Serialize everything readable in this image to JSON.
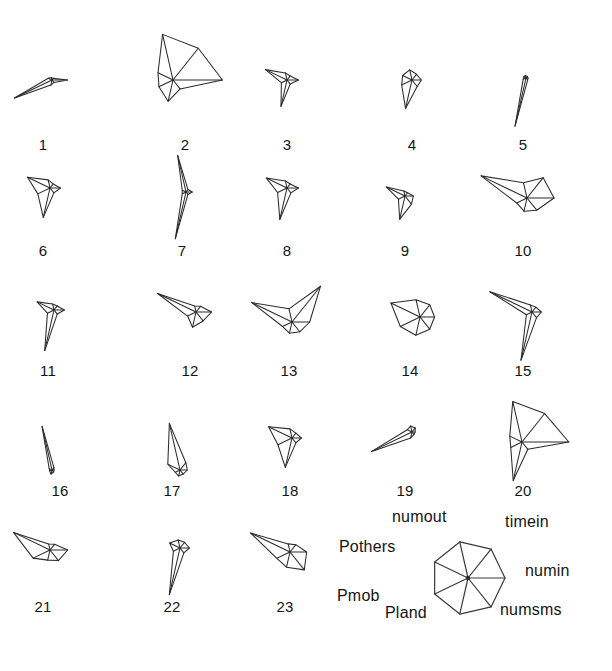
{
  "figure": {
    "type": "star-glyph-plot",
    "background": "#ffffff",
    "stroke_color": "#2b2b2b",
    "width": 612,
    "height": 671
  },
  "chart_data": {
    "type": "radar",
    "title": "",
    "subtitle": "",
    "xlabel": "",
    "ylabel": "",
    "grid": false,
    "legend_position": "bottom-right",
    "variables": [
      "numin",
      "timein",
      "numout",
      "Pothers",
      "Pmob",
      "Pland",
      "numsms"
    ],
    "axis_angles_deg": [
      0,
      51.43,
      102.86,
      154.29,
      205.71,
      257.14,
      308.57
    ],
    "axis_label_order_ccw_from_east": [
      "numin",
      "timein",
      "numout",
      "Pothers",
      "Pmob",
      "Pland",
      "numsms"
    ],
    "value_range": [
      0,
      1
    ],
    "radius_px": 52,
    "legend": {
      "center_x": 468,
      "center_y": 578,
      "radius_px": 37,
      "labels": {
        "numin": "numin",
        "timein": "timein",
        "numout": "numout",
        "Pothers": "Pothers",
        "Pmob": "Pmob",
        "Pland": "Pland",
        "numsms": "numsms"
      }
    },
    "series": [
      {
        "name": "1",
        "label": "1",
        "cx": 52,
        "cy": 80,
        "values": [
          0.3,
          0.04,
          0.05,
          0.08,
          0.8,
          0.1,
          0.06
        ]
      },
      {
        "name": "2",
        "label": "2",
        "cx": 173,
        "cy": 80,
        "values": [
          0.95,
          0.78,
          0.9,
          0.32,
          0.3,
          0.42,
          0.22
        ]
      },
      {
        "name": "3",
        "label": "3",
        "cx": 287,
        "cy": 80,
        "values": [
          0.22,
          0.1,
          0.14,
          0.46,
          0.12,
          0.52,
          0.1
        ]
      },
      {
        "name": "4",
        "label": "4",
        "cx": 412,
        "cy": 80,
        "values": [
          0.18,
          0.14,
          0.2,
          0.2,
          0.22,
          0.56,
          0.16
        ]
      },
      {
        "name": "5",
        "label": "5",
        "cx": 526,
        "cy": 78,
        "values": [
          0.04,
          0.04,
          0.05,
          0.05,
          0.06,
          0.95,
          0.05
        ]
      },
      {
        "name": "6",
        "label": "6",
        "cx": 50,
        "cy": 188,
        "values": [
          0.2,
          0.1,
          0.16,
          0.48,
          0.26,
          0.58,
          0.12
        ]
      },
      {
        "name": "7",
        "label": "7",
        "cx": 186,
        "cy": 192,
        "values": [
          0.12,
          0.06,
          0.72,
          0.08,
          0.08,
          0.92,
          0.06
        ]
      },
      {
        "name": "8",
        "label": "8",
        "cx": 287,
        "cy": 188,
        "values": [
          0.22,
          0.1,
          0.14,
          0.44,
          0.2,
          0.62,
          0.12
        ]
      },
      {
        "name": "9",
        "label": "9",
        "cx": 405,
        "cy": 196,
        "values": [
          0.16,
          0.08,
          0.1,
          0.4,
          0.14,
          0.46,
          0.2
        ]
      },
      {
        "name": "10",
        "label": "10",
        "cx": 527,
        "cy": 198,
        "values": [
          0.52,
          0.5,
          0.3,
          0.98,
          0.22,
          0.26,
          0.3
        ]
      },
      {
        "name": "11",
        "label": "11",
        "cx": 54,
        "cy": 310,
        "values": [
          0.2,
          0.1,
          0.12,
          0.36,
          0.14,
          0.8,
          0.1
        ]
      },
      {
        "name": "12",
        "label": "12",
        "cx": 196,
        "cy": 312,
        "values": [
          0.3,
          0.14,
          0.12,
          0.82,
          0.18,
          0.3,
          0.22
        ]
      },
      {
        "name": "13",
        "label": "13",
        "cx": 292,
        "cy": 322,
        "values": [
          0.34,
          0.88,
          0.26,
          0.86,
          0.2,
          0.22,
          0.24
        ]
      },
      {
        "name": "14",
        "label": "14",
        "cx": 420,
        "cy": 317,
        "values": [
          0.28,
          0.3,
          0.34,
          0.62,
          0.42,
          0.36,
          0.3
        ]
      },
      {
        "name": "15",
        "label": "15",
        "cx": 532,
        "cy": 312,
        "values": [
          0.18,
          0.12,
          0.14,
          0.9,
          0.12,
          0.95,
          0.14
        ]
      },
      {
        "name": "16",
        "label": "16",
        "cx": 52,
        "cy": 470,
        "values": [
          0.04,
          0.06,
          0.86,
          0.06,
          0.05,
          0.08,
          0.05
        ]
      },
      {
        "name": "17",
        "label": "17",
        "cx": 180,
        "cy": 470,
        "values": [
          0.14,
          0.18,
          0.92,
          0.26,
          0.1,
          0.12,
          0.1
        ]
      },
      {
        "name": "18",
        "label": "18",
        "cx": 292,
        "cy": 438,
        "values": [
          0.18,
          0.12,
          0.18,
          0.5,
          0.3,
          0.58,
          0.12
        ]
      },
      {
        "name": "19",
        "label": "19",
        "cx": 412,
        "cy": 432,
        "values": [
          0.06,
          0.1,
          0.12,
          0.1,
          0.86,
          0.12,
          0.06
        ]
      },
      {
        "name": "20",
        "label": "20",
        "cx": 522,
        "cy": 442,
        "values": [
          0.9,
          0.7,
          0.8,
          0.26,
          0.24,
          0.76,
          0.18
        ]
      },
      {
        "name": "21",
        "label": "21",
        "cx": 50,
        "cy": 550,
        "values": [
          0.34,
          0.14,
          0.12,
          0.78,
          0.36,
          0.2,
          0.26
        ]
      },
      {
        "name": "22",
        "label": "22",
        "cx": 180,
        "cy": 548,
        "values": [
          0.18,
          0.14,
          0.16,
          0.22,
          0.14,
          0.92,
          0.12
        ]
      },
      {
        "name": "23",
        "label": "23",
        "cx": 290,
        "cy": 552,
        "values": [
          0.32,
          0.18,
          0.16,
          0.84,
          0.28,
          0.3,
          0.44
        ]
      }
    ],
    "glyph_labels": [
      {
        "text": "1",
        "x": 43,
        "y": 136
      },
      {
        "text": "2",
        "x": 185,
        "y": 136
      },
      {
        "text": "3",
        "x": 287,
        "y": 136
      },
      {
        "text": "4",
        "x": 412,
        "y": 136
      },
      {
        "text": "5",
        "x": 523,
        "y": 136
      },
      {
        "text": "6",
        "x": 43,
        "y": 242
      },
      {
        "text": "7",
        "x": 182,
        "y": 242
      },
      {
        "text": "8",
        "x": 287,
        "y": 242
      },
      {
        "text": "9",
        "x": 405,
        "y": 242
      },
      {
        "text": "10",
        "x": 523,
        "y": 242
      },
      {
        "text": "11",
        "x": 48,
        "y": 362
      },
      {
        "text": "12",
        "x": 190,
        "y": 362
      },
      {
        "text": "13",
        "x": 289,
        "y": 362
      },
      {
        "text": "14",
        "x": 410,
        "y": 362
      },
      {
        "text": "15",
        "x": 523,
        "y": 362
      },
      {
        "text": "16",
        "x": 60,
        "y": 482
      },
      {
        "text": "17",
        "x": 172,
        "y": 482
      },
      {
        "text": "18",
        "x": 290,
        "y": 482
      },
      {
        "text": "19",
        "x": 405,
        "y": 482
      },
      {
        "text": "20",
        "x": 523,
        "y": 482
      },
      {
        "text": "21",
        "x": 43,
        "y": 598
      },
      {
        "text": "22",
        "x": 172,
        "y": 598
      },
      {
        "text": "23",
        "x": 285,
        "y": 598
      }
    ],
    "legend_axis_labels": [
      {
        "key": "numout",
        "text": "numout",
        "x": 392,
        "y": 508,
        "anchor": "start"
      },
      {
        "key": "timein",
        "text": "timein",
        "x": 505,
        "y": 513,
        "anchor": "start"
      },
      {
        "key": "Pothers",
        "text": "Pothers",
        "x": 339,
        "y": 538,
        "anchor": "start"
      },
      {
        "key": "numin",
        "text": "numin",
        "x": 525,
        "y": 562,
        "anchor": "start"
      },
      {
        "key": "Pmob",
        "text": "Pmob",
        "x": 337,
        "y": 587,
        "anchor": "start"
      },
      {
        "key": "numsms",
        "text": "numsms",
        "x": 500,
        "y": 601,
        "anchor": "start"
      },
      {
        "key": "Pland",
        "text": "Pland",
        "x": 385,
        "y": 604,
        "anchor": "start"
      }
    ]
  }
}
